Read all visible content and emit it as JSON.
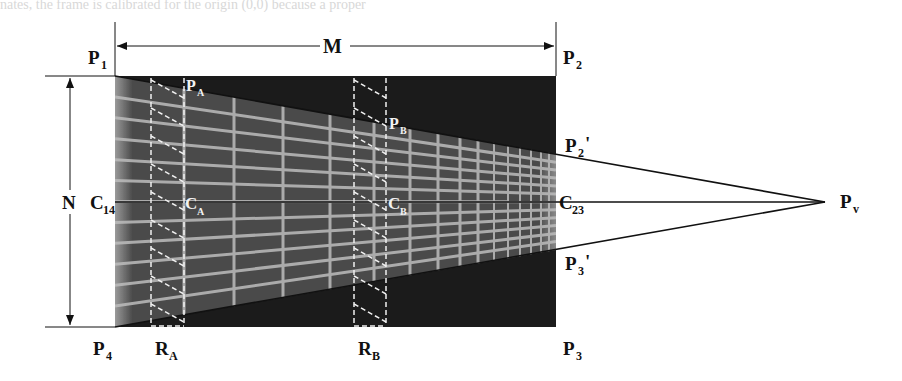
{
  "figure": {
    "type": "perspective-grid-diagram",
    "background_text_fragment": "nates, the frame is calibrated for the origin (0,0) because a proper",
    "labels": {
      "P1": {
        "main": "P",
        "sub": "1",
        "prime": ""
      },
      "P2": {
        "main": "P",
        "sub": "2",
        "prime": ""
      },
      "P3": {
        "main": "P",
        "sub": "3",
        "prime": ""
      },
      "P4": {
        "main": "P",
        "sub": "4",
        "prime": ""
      },
      "P2p": {
        "main": "P",
        "sub": "2",
        "prime": "'"
      },
      "P3p": {
        "main": "P",
        "sub": "3",
        "prime": "'"
      },
      "PA": {
        "main": "P",
        "sub": "A"
      },
      "PB": {
        "main": "P",
        "sub": "B"
      },
      "C14": {
        "main": "C",
        "sub": "14"
      },
      "CA": {
        "main": "C",
        "sub": "A"
      },
      "CB": {
        "main": "C",
        "sub": "B"
      },
      "C23": {
        "main": "C",
        "sub": "23"
      },
      "Pv": {
        "main": "P",
        "sub": "v"
      },
      "RA": {
        "main": "R",
        "sub": "A"
      },
      "RB": {
        "main": "R",
        "sub": "B"
      },
      "M": "M",
      "N": "N"
    },
    "geometry": {
      "rect": {
        "x1": 115,
        "y1": 76,
        "x2": 556,
        "y2": 327
      },
      "center_y": 202,
      "vanishing_point": {
        "x": 825,
        "y": 202
      },
      "p2_prime_y": 154,
      "p3_prime_y": 250,
      "strip_A": {
        "x1": 151,
        "x2": 184
      },
      "strip_B": {
        "x1": 354,
        "x2": 386
      },
      "dimension_M_y": 46,
      "dimension_N_x": 70
    },
    "colors": {
      "dark_region": "#1a1a1a",
      "grid_fill": "#4a4a4a",
      "grid_lines": "#c8c8c8",
      "dashed": "#f0f0f0",
      "ink": "#111111"
    }
  }
}
